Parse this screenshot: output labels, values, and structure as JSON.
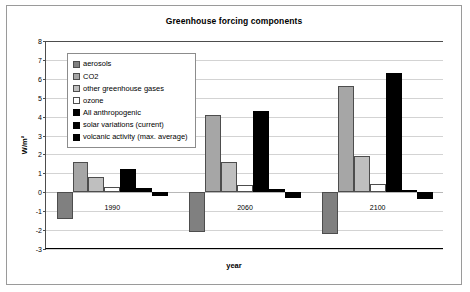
{
  "chart_data": {
    "type": "bar",
    "title": "Greenhouse forcing components",
    "xlabel": "year",
    "ylabel": "W/m²",
    "categories": [
      "1990",
      "2060",
      "2100"
    ],
    "ylim": [
      -3,
      8
    ],
    "yticks": [
      -3,
      -2,
      -1,
      0,
      1,
      2,
      3,
      4,
      5,
      6,
      7,
      8
    ],
    "grid": true,
    "legend_position": "top-left",
    "series": [
      {
        "name": "aerosols",
        "color": "#808080",
        "outlined": true,
        "values": [
          -1.4,
          -2.1,
          -2.2
        ]
      },
      {
        "name": "CO2",
        "color": "#a6a6a6",
        "outlined": true,
        "values": [
          1.6,
          4.1,
          5.6
        ]
      },
      {
        "name": "other greenhouse gases",
        "color": "#bfbfbf",
        "outlined": true,
        "values": [
          0.8,
          1.6,
          1.9
        ]
      },
      {
        "name": "ozone",
        "color": "#ffffff",
        "outlined": true,
        "values": [
          0.27,
          0.4,
          0.42
        ]
      },
      {
        "name": "All anthropogenic",
        "color": "#000000",
        "outlined": false,
        "values": [
          1.25,
          4.3,
          6.3
        ]
      },
      {
        "name": "solar variations (current)",
        "color": "#000000",
        "outlined": false,
        "values": [
          0.25,
          0.17,
          0.1
        ]
      },
      {
        "name": "volcanic activity (max. average)",
        "color": "#000000",
        "outlined": false,
        "values": [
          -0.2,
          -0.3,
          -0.35
        ]
      }
    ]
  }
}
